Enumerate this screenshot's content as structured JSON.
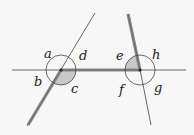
{
  "diagram": {
    "type": "angles at two transversal intersections",
    "colors": {
      "background": "#f7f7f7",
      "line": "#333333",
      "thick_path": "#8a8a8a",
      "shaded_angle": "#c8c8c8",
      "circle": "#444444"
    },
    "intersections": [
      {
        "name": "left",
        "x": 61,
        "y": 70,
        "angles": [
          "a",
          "b",
          "c",
          "d"
        ],
        "shaded": "c"
      },
      {
        "name": "right",
        "x": 140,
        "y": 70,
        "angles": [
          "e",
          "f",
          "g",
          "h"
        ],
        "shaded": "e"
      }
    ],
    "labels": {
      "a": "a",
      "b": "b",
      "c": "c",
      "d": "d",
      "e": "e",
      "f": "f",
      "g": "g",
      "h": "h"
    }
  }
}
